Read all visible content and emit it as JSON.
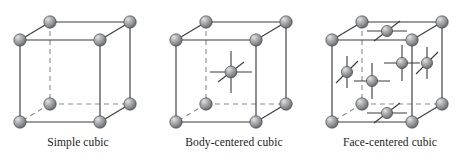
{
  "figure": {
    "background_color": "#ffffff",
    "style": {
      "edge_solid_color": "#3b3b3b",
      "edge_hidden_color": "#8a8a8a",
      "stub_color": "#3b3b3b",
      "sphere_fill": "#8f9194",
      "sphere_highlight": "#d8dadc",
      "sphere_shadow": "#5d6063",
      "sphere_outline": "#4a4c4f",
      "caption_color": "#1b1b1b",
      "sphere_radius": 6.2,
      "face_sphere_radius": 5.6
    },
    "geometry": {
      "front_top_left": [
        20,
        40
      ],
      "front_top_right": [
        100,
        40
      ],
      "front_bottom_left": [
        20,
        122
      ],
      "front_bottom_right": [
        100,
        122
      ],
      "back_top_left": [
        50,
        22
      ],
      "back_top_right": [
        130,
        22
      ],
      "back_bottom_left": [
        50,
        104
      ],
      "back_bottom_right": [
        130,
        104
      ]
    }
  },
  "cells": [
    {
      "id": "simple-cubic",
      "label": "Simple cubic",
      "x_offset": 0,
      "corner_atoms": 8,
      "interior_atoms": 0,
      "face_atoms": 0,
      "atom_count_total": 8
    },
    {
      "id": "body-centered-cubic",
      "label": "Body-centered cubic",
      "x_offset": 156,
      "corner_atoms": 8,
      "interior_atoms": 1,
      "face_atoms": 0,
      "atom_count_total": 9
    },
    {
      "id": "face-centered-cubic",
      "label": "Face-centered cubic",
      "x_offset": 312,
      "corner_atoms": 8,
      "interior_atoms": 0,
      "face_atoms": 6,
      "atom_count_total": 14
    }
  ]
}
